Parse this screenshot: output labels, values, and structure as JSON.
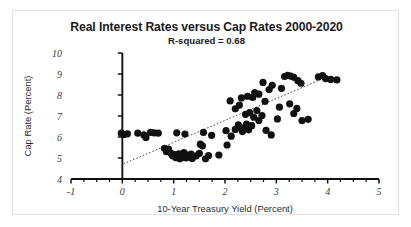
{
  "chart_data": {
    "type": "scatter",
    "title": "Real Interest Rates versus Cap Rates 2000-2020",
    "subtitle": "R-squared = 0.68",
    "xlabel": "10-Year Treasury Yield (Percent)",
    "ylabel": "Cap Rate (Percent)",
    "xlim": [
      -1,
      5
    ],
    "ylim": [
      4,
      10
    ],
    "xticks": [
      -1,
      0,
      1,
      2,
      3,
      4,
      5
    ],
    "xtick_labels": [
      "-1",
      "0",
      "1",
      "2",
      "3",
      "4",
      "5"
    ],
    "yticks": [
      4,
      5,
      6,
      7,
      8,
      9,
      10
    ],
    "ytick_labels": [
      "4",
      "5",
      "6",
      "7",
      "8",
      "9",
      "10"
    ],
    "x_minor_tick_step": 0.25,
    "grid": false,
    "legend": false,
    "r_squared": 0.68,
    "marker": "filled-circle",
    "marker_color": "#111111",
    "trendline": {
      "style": "dotted",
      "color": "#4a4a4a",
      "x_start": 0.02,
      "y_start": 4.72,
      "x_end": 3.85,
      "y_end": 8.72
    },
    "points": [
      {
        "x": -0.02,
        "y": 6.18
      },
      {
        "x": 0.03,
        "y": 6.12
      },
      {
        "x": 0.1,
        "y": 6.15
      },
      {
        "x": 0.3,
        "y": 6.18
      },
      {
        "x": 0.42,
        "y": 6.1
      },
      {
        "x": 0.46,
        "y": 5.98
      },
      {
        "x": 0.55,
        "y": 6.22
      },
      {
        "x": 0.62,
        "y": 6.2
      },
      {
        "x": 0.7,
        "y": 6.18
      },
      {
        "x": 0.82,
        "y": 5.46
      },
      {
        "x": 0.86,
        "y": 5.3
      },
      {
        "x": 0.9,
        "y": 5.42
      },
      {
        "x": 0.95,
        "y": 5.22
      },
      {
        "x": 0.98,
        "y": 5.1
      },
      {
        "x": 1.02,
        "y": 5.16
      },
      {
        "x": 1.04,
        "y": 5.02
      },
      {
        "x": 1.08,
        "y": 5.08
      },
      {
        "x": 1.1,
        "y": 5.2
      },
      {
        "x": 1.12,
        "y": 4.96
      },
      {
        "x": 1.16,
        "y": 5.12
      },
      {
        "x": 1.18,
        "y": 5.04
      },
      {
        "x": 1.2,
        "y": 5.26
      },
      {
        "x": 1.24,
        "y": 5.0
      },
      {
        "x": 1.26,
        "y": 5.14
      },
      {
        "x": 1.3,
        "y": 5.06
      },
      {
        "x": 1.34,
        "y": 5.18
      },
      {
        "x": 1.36,
        "y": 4.98
      },
      {
        "x": 1.06,
        "y": 6.2
      },
      {
        "x": 1.22,
        "y": 6.14
      },
      {
        "x": 1.44,
        "y": 5.1
      },
      {
        "x": 1.5,
        "y": 5.22
      },
      {
        "x": 1.52,
        "y": 5.66
      },
      {
        "x": 1.56,
        "y": 5.58
      },
      {
        "x": 1.62,
        "y": 4.96
      },
      {
        "x": 1.68,
        "y": 5.12
      },
      {
        "x": 1.58,
        "y": 6.22
      },
      {
        "x": 1.74,
        "y": 6.08
      },
      {
        "x": 1.88,
        "y": 5.14
      },
      {
        "x": 2.02,
        "y": 6.3
      },
      {
        "x": 2.12,
        "y": 6.04
      },
      {
        "x": 2.2,
        "y": 6.36
      },
      {
        "x": 2.26,
        "y": 6.58
      },
      {
        "x": 2.3,
        "y": 6.46
      },
      {
        "x": 2.34,
        "y": 6.26
      },
      {
        "x": 2.38,
        "y": 6.4
      },
      {
        "x": 2.42,
        "y": 6.62
      },
      {
        "x": 2.46,
        "y": 6.34
      },
      {
        "x": 2.52,
        "y": 6.54
      },
      {
        "x": 2.4,
        "y": 7.08
      },
      {
        "x": 2.48,
        "y": 7.16
      },
      {
        "x": 2.56,
        "y": 6.94
      },
      {
        "x": 2.62,
        "y": 7.26
      },
      {
        "x": 2.66,
        "y": 6.78
      },
      {
        "x": 2.72,
        "y": 7.02
      },
      {
        "x": 2.2,
        "y": 7.34
      },
      {
        "x": 2.28,
        "y": 7.52
      },
      {
        "x": 2.1,
        "y": 7.72
      },
      {
        "x": 2.32,
        "y": 7.86
      },
      {
        "x": 2.54,
        "y": 7.88
      },
      {
        "x": 2.66,
        "y": 8.04
      },
      {
        "x": 2.78,
        "y": 7.7
      },
      {
        "x": 2.86,
        "y": 8.26
      },
      {
        "x": 2.92,
        "y": 8.46
      },
      {
        "x": 2.74,
        "y": 8.6
      },
      {
        "x": 2.58,
        "y": 8.12
      },
      {
        "x": 2.44,
        "y": 7.94
      },
      {
        "x": 2.8,
        "y": 6.32
      },
      {
        "x": 2.9,
        "y": 6.1
      },
      {
        "x": 3.02,
        "y": 6.86
      },
      {
        "x": 3.06,
        "y": 7.42
      },
      {
        "x": 3.1,
        "y": 8.32
      },
      {
        "x": 3.16,
        "y": 8.88
      },
      {
        "x": 3.22,
        "y": 8.94
      },
      {
        "x": 3.28,
        "y": 8.9
      },
      {
        "x": 3.34,
        "y": 8.84
      },
      {
        "x": 3.42,
        "y": 8.68
      },
      {
        "x": 3.48,
        "y": 8.56
      },
      {
        "x": 3.26,
        "y": 7.58
      },
      {
        "x": 3.34,
        "y": 7.12
      },
      {
        "x": 3.4,
        "y": 7.36
      },
      {
        "x": 3.5,
        "y": 6.78
      },
      {
        "x": 3.62,
        "y": 6.84
      },
      {
        "x": 3.82,
        "y": 8.86
      },
      {
        "x": 3.9,
        "y": 8.92
      },
      {
        "x": 3.96,
        "y": 8.78
      },
      {
        "x": 4.06,
        "y": 8.74
      },
      {
        "x": 4.18,
        "y": 8.72
      },
      {
        "x": 2.04,
        "y": 5.62
      }
    ]
  }
}
